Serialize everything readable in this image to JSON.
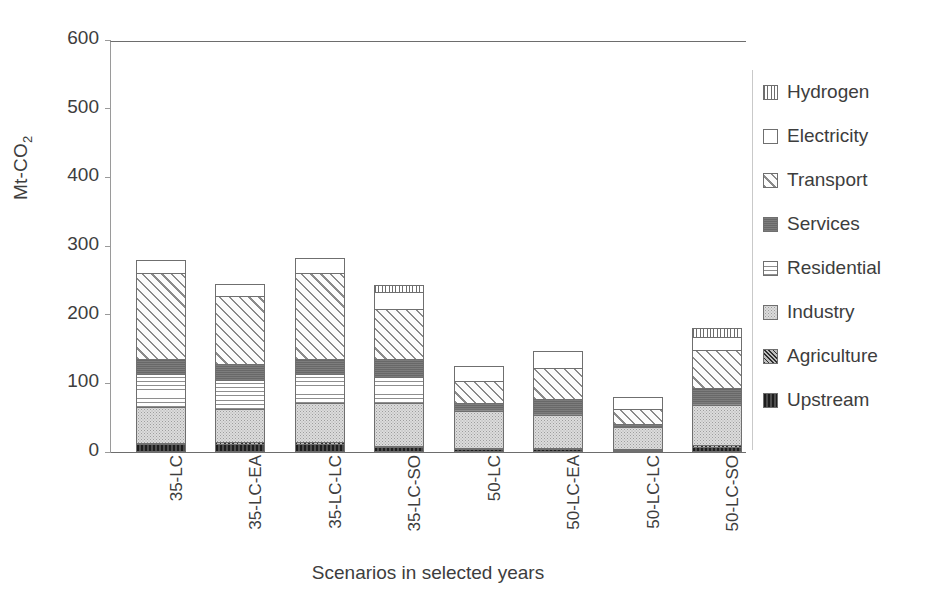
{
  "chart_data": {
    "type": "bar",
    "subtype": "stacked-bar",
    "title": "",
    "xlabel": "Scenarios in selected  years",
    "ylabel": "Mt-CO",
    "ylabel_sub": "2",
    "ylim": [
      0,
      600
    ],
    "yticks": [
      0,
      100,
      200,
      300,
      400,
      500,
      600
    ],
    "ytick_labels": [
      "0",
      "100",
      "200",
      "300",
      "400",
      "500",
      "600"
    ],
    "grid": false,
    "legend_position": "right",
    "categories": [
      "35-LC",
      "35-LC-EA",
      "35-LC-LC",
      "35-LC-SO",
      "50-LC",
      "50-LC-EA",
      "50-LC-LC",
      "50-LC-SO"
    ],
    "series": [
      {
        "name": "Upstream",
        "pattern": "solid-dark",
        "values": [
          11,
          12,
          12,
          7,
          4,
          4,
          2,
          8
        ]
      },
      {
        "name": "Agriculture",
        "pattern": "dense-diagonal",
        "values": [
          2,
          2,
          2,
          2,
          2,
          2,
          2,
          2
        ]
      },
      {
        "name": "Industry",
        "pattern": "light-gray-stipple",
        "values": [
          53,
          48,
          57,
          62,
          54,
          48,
          32,
          58
        ]
      },
      {
        "name": "Residential",
        "pattern": "horizontal-lines",
        "values": [
          47,
          43,
          42,
          38,
          3,
          3,
          2,
          4
        ]
      },
      {
        "name": "Services",
        "pattern": "solid-gray",
        "values": [
          23,
          23,
          23,
          27,
          9,
          20,
          3,
          21
        ]
      },
      {
        "name": "Transport",
        "pattern": "diagonal-hatch",
        "values": [
          125,
          100,
          125,
          73,
          32,
          46,
          21,
          55
        ]
      },
      {
        "name": "Electricity",
        "pattern": "white",
        "values": [
          19,
          17,
          22,
          24,
          22,
          24,
          18,
          19
        ]
      },
      {
        "name": "Hydrogen",
        "pattern": "vertical-lines",
        "values": [
          0,
          0,
          0,
          11,
          0,
          0,
          0,
          13
        ]
      }
    ],
    "totals": [
      280,
      245,
      283,
      244,
      126,
      147,
      80,
      180
    ],
    "legend_order": [
      "Hydrogen",
      "Electricity",
      "Transport",
      "Services",
      "Residential",
      "Industry",
      "Agriculture",
      "Upstream"
    ]
  },
  "colors": {
    "axis": "#6d6d6d",
    "tick": "#9a9a9a",
    "text": "#3d3d3d",
    "upstream": "#2e2e2e",
    "agriculture": "#5f5f5f",
    "industry": "#dcdcdc",
    "residential": "#ffffff",
    "services": "#6e6e6e",
    "transport": "#fafafa",
    "electricity": "#ffffff",
    "hydrogen": "#ffffff"
  }
}
